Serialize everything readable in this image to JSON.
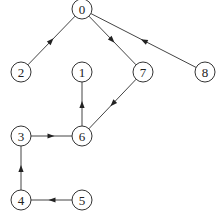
{
  "diagram": {
    "type": "directed-graph",
    "nodes": [
      {
        "id": "0",
        "label": "0",
        "x": 82,
        "y": 9
      },
      {
        "id": "1",
        "label": "1",
        "x": 82,
        "y": 72
      },
      {
        "id": "2",
        "label": "2",
        "x": 21,
        "y": 72
      },
      {
        "id": "3",
        "label": "3",
        "x": 21,
        "y": 136
      },
      {
        "id": "4",
        "label": "4",
        "x": 21,
        "y": 200
      },
      {
        "id": "5",
        "label": "5",
        "x": 82,
        "y": 200
      },
      {
        "id": "6",
        "label": "6",
        "x": 82,
        "y": 136
      },
      {
        "id": "7",
        "label": "7",
        "x": 143,
        "y": 72
      },
      {
        "id": "8",
        "label": "8",
        "x": 205,
        "y": 72
      }
    ],
    "edges": [
      {
        "from": "2",
        "to": "0"
      },
      {
        "from": "0",
        "to": "7"
      },
      {
        "from": "8",
        "to": "0"
      },
      {
        "from": "7",
        "to": "6"
      },
      {
        "from": "6",
        "to": "1"
      },
      {
        "from": "3",
        "to": "6"
      },
      {
        "from": "4",
        "to": "3"
      },
      {
        "from": "5",
        "to": "4"
      }
    ],
    "node_radius": 10
  }
}
